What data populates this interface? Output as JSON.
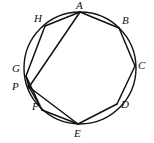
{
  "figure": {
    "type": "geometry-diagram",
    "background_color": "#ffffff",
    "stroke_color": "#111111",
    "circle": {
      "name": "circumscribed-circle",
      "center_x": 80,
      "center_y": 68,
      "radius": 56,
      "stroke_width": 1.4
    },
    "points": [
      {
        "id": "A",
        "label": "A",
        "cx": 80,
        "cy": 12,
        "label_x": 76,
        "label_y": 0
      },
      {
        "id": "B",
        "label": "B",
        "cx": 119,
        "cy": 28,
        "label_x": 122,
        "label_y": 15
      },
      {
        "id": "C",
        "label": "C",
        "cx": 135,
        "cy": 66,
        "label_x": 138,
        "label_y": 60
      },
      {
        "id": "D",
        "label": "D",
        "cx": 117,
        "cy": 104,
        "label_x": 121,
        "label_y": 99
      },
      {
        "id": "E",
        "label": "E",
        "cx": 78,
        "cy": 124,
        "label_x": 74,
        "label_y": 128
      },
      {
        "id": "F",
        "label": "F",
        "cx": 42,
        "cy": 110,
        "label_x": 32,
        "label_y": 101
      },
      {
        "id": "G",
        "label": "G",
        "cx": 26,
        "cy": 76,
        "label_x": 12,
        "label_y": 63
      },
      {
        "id": "H",
        "label": "H",
        "cx": 45,
        "cy": 26,
        "label_x": 34,
        "label_y": 13
      },
      {
        "id": "P",
        "label": "P",
        "cx": 29,
        "cy": 87,
        "label_x": 12,
        "label_y": 81
      }
    ],
    "polygon_edges": [
      {
        "name": "edge-A-B",
        "from": "A",
        "to": "B"
      },
      {
        "name": "edge-B-C",
        "from": "B",
        "to": "C"
      },
      {
        "name": "edge-C-D",
        "from": "C",
        "to": "D"
      },
      {
        "name": "edge-D-E",
        "from": "D",
        "to": "E"
      },
      {
        "name": "edge-E-F",
        "from": "E",
        "to": "F"
      },
      {
        "name": "edge-F-G",
        "from": "F",
        "to": "G"
      },
      {
        "name": "edge-G-H",
        "from": "G",
        "to": "H"
      },
      {
        "name": "edge-H-A",
        "from": "H",
        "to": "A"
      }
    ],
    "chords": [
      {
        "name": "chord-A-P",
        "from": "A",
        "to": "P"
      },
      {
        "name": "chord-P-E",
        "from": "P",
        "to": "E"
      },
      {
        "name": "chord-G-P",
        "from": "G",
        "to": "P"
      },
      {
        "name": "chord-P-F",
        "from": "P",
        "to": "F"
      }
    ],
    "edge_stroke_width": 1.5,
    "chord_stroke_width": 1.5
  }
}
